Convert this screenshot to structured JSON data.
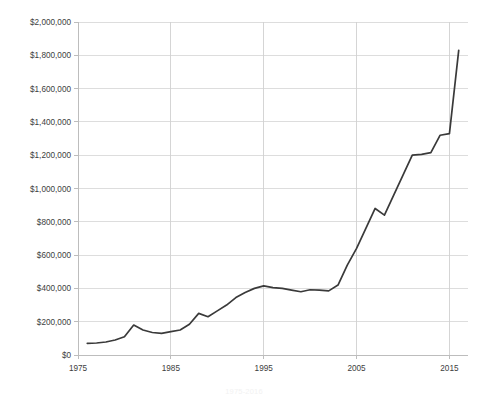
{
  "chart_data": {
    "type": "line",
    "title": "",
    "subtitle": "",
    "xlabel": "",
    "ylabel": "",
    "xlim": [
      1975,
      2017
    ],
    "ylim": [
      0,
      2000000
    ],
    "grid": true,
    "legend": false,
    "legend_position": "none",
    "line_color": "#3a3a3a",
    "grid_color": "#d9d9d9",
    "axis_color": "#bdbdbd",
    "background_color": "#ffffff",
    "y_tick_labels": [
      "$0",
      "$200,000",
      "$400,000",
      "$600,000",
      "$800,000",
      "$1,000,000",
      "$1,200,000",
      "$1,400,000",
      "$1,600,000",
      "$1,800,000",
      "$2,000,000"
    ],
    "y_tick_values": [
      0,
      200000,
      400000,
      600000,
      800000,
      1000000,
      1200000,
      1400000,
      1600000,
      1800000,
      2000000
    ],
    "x_tick_labels": [
      "1975",
      "1985",
      "1995",
      "2005",
      "2015"
    ],
    "x_tick_values": [
      1975,
      1985,
      1995,
      2005,
      2015
    ],
    "x": [
      1976,
      1977,
      1978,
      1979,
      1980,
      1981,
      1982,
      1983,
      1984,
      1985,
      1986,
      1987,
      1988,
      1989,
      1990,
      1991,
      1992,
      1993,
      1994,
      1995,
      1996,
      1997,
      1998,
      1999,
      2000,
      2001,
      2002,
      2003,
      2004,
      2005,
      2006,
      2007,
      2008,
      2009,
      2010,
      2011,
      2012,
      2013,
      2014,
      2015,
      2016
    ],
    "values": [
      70000,
      72000,
      78000,
      90000,
      110000,
      180000,
      150000,
      135000,
      130000,
      140000,
      150000,
      185000,
      250000,
      230000,
      265000,
      300000,
      345000,
      375000,
      400000,
      415000,
      405000,
      400000,
      390000,
      380000,
      392000,
      390000,
      385000,
      420000,
      540000,
      640000,
      760000,
      880000,
      840000,
      960000,
      1080000,
      1200000,
      1205000,
      1215000,
      1320000,
      1330000,
      1830000
    ],
    "series": [
      {
        "name": "value",
        "values": [
          70000,
          72000,
          78000,
          90000,
          110000,
          180000,
          150000,
          135000,
          130000,
          140000,
          150000,
          185000,
          250000,
          230000,
          265000,
          300000,
          345000,
          375000,
          400000,
          415000,
          405000,
          400000,
          390000,
          380000,
          392000,
          390000,
          385000,
          420000,
          540000,
          640000,
          760000,
          880000,
          840000,
          960000,
          1080000,
          1200000,
          1205000,
          1215000,
          1320000,
          1330000,
          1830000
        ]
      }
    ],
    "annotations": []
  },
  "caption": {
    "text": "1975-2016"
  }
}
